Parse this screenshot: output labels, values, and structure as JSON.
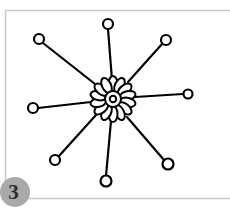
{
  "figure": {
    "step_number": "3",
    "frame_color": "#c8c8c8",
    "line_color": "#000000",
    "badge_color": "#a9a9a9",
    "center": [
      113,
      99
    ],
    "petal_count": 14,
    "spokes": [
      {
        "name": "top",
        "end": [
          108,
          24
        ]
      },
      {
        "name": "upper-right",
        "end": [
          166,
          40
        ]
      },
      {
        "name": "right",
        "end": [
          188,
          94
        ]
      },
      {
        "name": "lower-right",
        "end": [
          168,
          164
        ]
      },
      {
        "name": "bottom",
        "end": [
          106,
          181
        ]
      },
      {
        "name": "lower-left",
        "end": [
          55,
          160
        ]
      },
      {
        "name": "left",
        "end": [
          33,
          108
        ]
      },
      {
        "name": "upper-left",
        "end": [
          39,
          39
        ]
      }
    ]
  }
}
